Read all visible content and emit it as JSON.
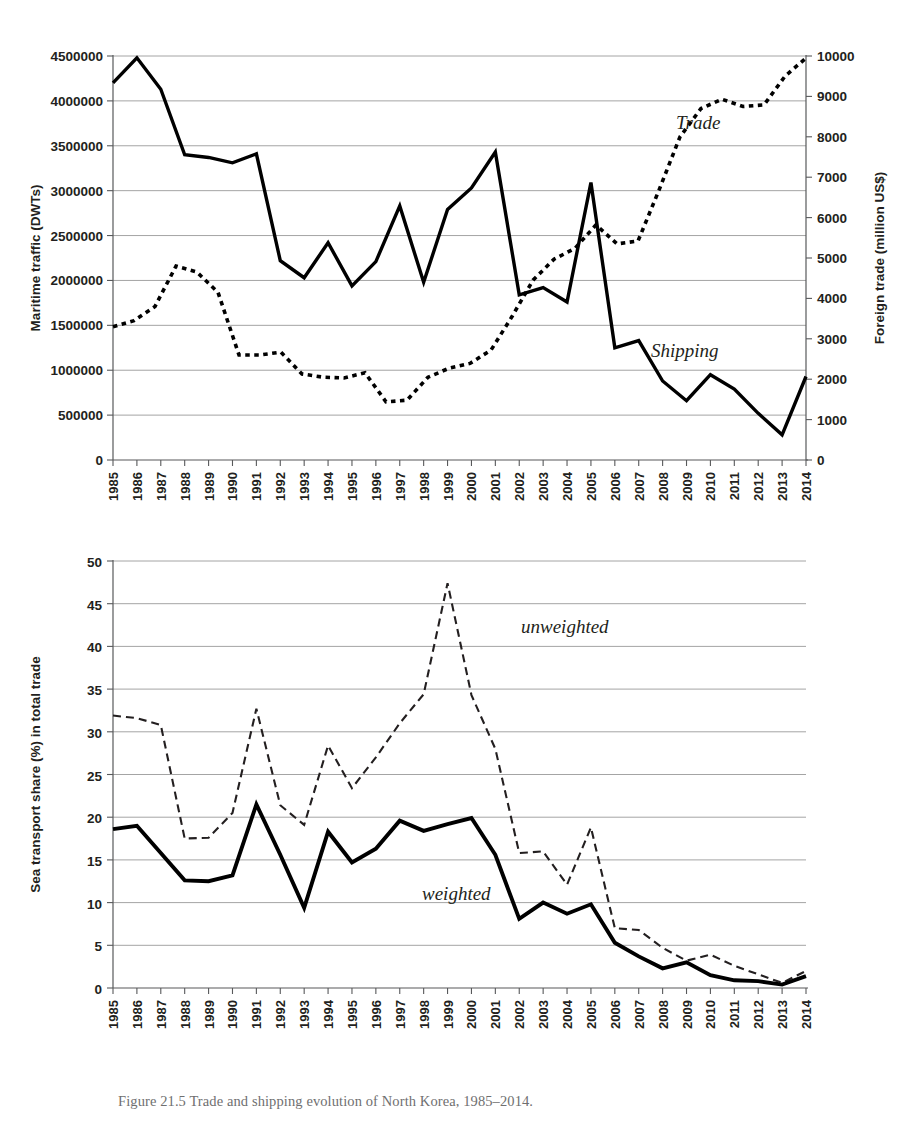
{
  "figure": {
    "caption": "Figure 21.5 Trade and shipping evolution of North Korea, 1985–2014."
  },
  "chart_data": [
    {
      "type": "line",
      "panel": "top",
      "title": "",
      "xlabel": "",
      "ylabel": "Maritime traffic (DWTs)",
      "y2label": "Foreign trade (million US$)",
      "ylim": [
        0,
        4500000
      ],
      "y2lim": [
        0,
        10000
      ],
      "yticks": [
        0,
        500000,
        1000000,
        1500000,
        2000000,
        2500000,
        3000000,
        3500000,
        4000000,
        4500000
      ],
      "ytick_labels": [
        "0",
        "500000",
        "1000000",
        "1500000",
        "2000000",
        "2500000",
        "3000000",
        "3500000",
        "4000000",
        "4500000"
      ],
      "y2ticks": [
        0,
        1000,
        2000,
        3000,
        4000,
        5000,
        6000,
        7000,
        8000,
        9000,
        10000
      ],
      "y2tick_labels": [
        "0",
        "1000",
        "2000",
        "3000",
        "4000",
        "5000",
        "6000",
        "7000",
        "8000",
        "9000",
        "10000"
      ],
      "grid": true,
      "legend_position": "inline-annotation",
      "categories": [
        "1985",
        "1986",
        "1987",
        "1988",
        "1989",
        "1990",
        "1991",
        "1992",
        "1993",
        "1994",
        "1995",
        "1996",
        "1997",
        "1998",
        "1999",
        "2000",
        "2001",
        "2002",
        "2003",
        "2004",
        "2005",
        "2006",
        "2007",
        "2008",
        "2009",
        "2010",
        "2011",
        "2012",
        "2013",
        "2014"
      ],
      "series": [
        {
          "name": "Shipping",
          "style": "solid",
          "axis": "left",
          "unit": "DWTs",
          "values": [
            4200000,
            4480000,
            4130000,
            3400000,
            3370000,
            3310000,
            3410000,
            2220000,
            2030000,
            2420000,
            1940000,
            2210000,
            2830000,
            1980000,
            2790000,
            3030000,
            3430000,
            1840000,
            1920000,
            1760000,
            3090000,
            1250000,
            1330000,
            880000,
            660000,
            950000,
            790000,
            520000,
            280000,
            930000
          ]
        },
        {
          "name": "Trade",
          "style": "dotted",
          "axis": "right",
          "unit": "million US$",
          "values": [
            3300,
            3450,
            3800,
            4800,
            4650,
            4150,
            2600,
            2600,
            2670,
            2130,
            2050,
            2030,
            2160,
            1440,
            1480,
            2050,
            2270,
            2390,
            2720,
            3550,
            4450,
            4970,
            5240,
            5820,
            5350,
            5420,
            6680,
            8000,
            8700,
            8930,
            8750,
            8790,
            9500,
            9950
          ]
        }
      ],
      "annotations": [
        {
          "text": "Trade",
          "x": "2008",
          "y": 8500
        },
        {
          "text": "Shipping",
          "x": "2007",
          "y": 2900
        }
      ]
    },
    {
      "type": "line",
      "panel": "bottom",
      "title": "",
      "xlabel": "",
      "ylabel": "Sea transport share (%) in total trade",
      "ylim": [
        0,
        50
      ],
      "yticks": [
        0,
        5,
        10,
        15,
        20,
        25,
        30,
        35,
        40,
        45,
        50
      ],
      "ytick_labels": [
        "0",
        "5",
        "10",
        "15",
        "20",
        "25",
        "30",
        "35",
        "40",
        "45",
        "50"
      ],
      "grid": true,
      "legend_position": "inline-annotation",
      "categories": [
        "1985",
        "1986",
        "1987",
        "1988",
        "1989",
        "1990",
        "1991",
        "1992",
        "1993",
        "1994",
        "1995",
        "1996",
        "1997",
        "1998",
        "1999",
        "2000",
        "2001",
        "2002",
        "2003",
        "2004",
        "2005",
        "2006",
        "2007",
        "2008",
        "2009",
        "2010",
        "2011",
        "2012",
        "2013",
        "2014"
      ],
      "series": [
        {
          "name": "unweighted",
          "style": "dashed",
          "axis": "left",
          "unit": "%",
          "values": [
            31.9,
            31.6,
            30.8,
            17.5,
            17.6,
            20.5,
            32.7,
            21.4,
            19.1,
            28.4,
            23.4,
            27.0,
            31.0,
            34.4,
            47.4,
            34.3,
            28.0,
            15.8,
            16.0,
            12.1,
            18.8,
            7.0,
            6.8,
            4.7,
            3.2,
            3.9,
            2.6,
            1.6,
            0.6,
            2.0
          ]
        },
        {
          "name": "weighted",
          "style": "solid",
          "axis": "left",
          "unit": "%",
          "values": [
            18.6,
            19.0,
            15.8,
            12.6,
            12.5,
            13.2,
            21.5,
            15.6,
            9.4,
            18.3,
            14.7,
            16.3,
            19.6,
            18.4,
            19.2,
            19.9,
            15.6,
            8.1,
            10.0,
            8.7,
            9.8,
            5.3,
            3.7,
            2.3,
            3.0,
            1.5,
            0.9,
            0.8,
            0.4,
            1.4
          ]
        }
      ],
      "annotations": [
        {
          "text": "unweighted",
          "x": "2004",
          "y": 38.0
        },
        {
          "text": "weighted",
          "x": "2001",
          "y": 12.5
        }
      ]
    }
  ]
}
